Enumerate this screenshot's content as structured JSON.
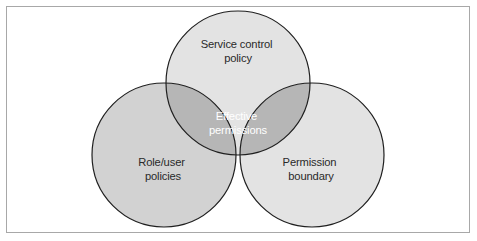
{
  "figure": {
    "type": "venn-diagram-3-set",
    "background_color": "#ffffff",
    "frame": {
      "border_color": "#a8a8a8",
      "border_width": 1
    },
    "stroke_color": "#1f1f1f",
    "stroke_width": 1.2,
    "colors": {
      "set_light": "#e3e3e3",
      "set_left": "#d2d2d2",
      "pair_overlap": "#b6b6b6",
      "triple_overlap": "#ababab",
      "label_dark": "#2a2a2a",
      "label_light": "#ffffff"
    },
    "sets": [
      {
        "id": "service-control-policy",
        "label_line1": "Service control",
        "label_line2": "policy",
        "cx": 238,
        "cy": 83,
        "r": 72,
        "fill": "#e3e3e3",
        "label_x": 238,
        "label_y": 48,
        "label_color": "#2a2a2a"
      },
      {
        "id": "role-user-policies",
        "label_line1": "Role/user",
        "label_line2": "policies",
        "cx": 164,
        "cy": 155,
        "r": 72,
        "fill": "#d2d2d2",
        "label_x": 163,
        "label_y": 166,
        "label_color": "#2a2a2a"
      },
      {
        "id": "permission-boundary",
        "label_line1": "Permission",
        "label_line2": "boundary",
        "cx": 312,
        "cy": 155,
        "r": 72,
        "fill": "#e3e3e3",
        "label_x": 311,
        "label_y": 166,
        "label_color": "#2a2a2a"
      }
    ],
    "intersection": {
      "id": "effective-permissions",
      "label_line1": "Effective",
      "label_line2": "permissions",
      "label_x": 238,
      "label_y": 120,
      "fill": "#ababab",
      "label_color": "#ffffff"
    }
  }
}
